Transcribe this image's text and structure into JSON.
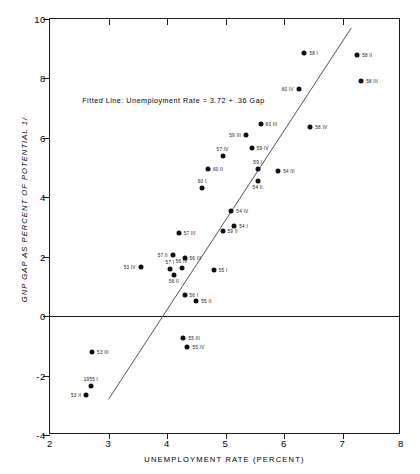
{
  "chart_data": {
    "type": "scatter",
    "title": "",
    "xlabel": "UNEMPLOYMENT RATE (PERCENT)",
    "ylabel": "GNP GAP AS PERCENT OF POTENTIAL 1/",
    "xlim": [
      2,
      8
    ],
    "ylim": [
      -4,
      10
    ],
    "xticks": [
      2,
      3,
      4,
      5,
      6,
      7,
      8
    ],
    "yticks": [
      -4,
      -2,
      0,
      2,
      4,
      6,
      8,
      10
    ],
    "grid": false,
    "legend": null,
    "annotation": "Fitted Line: Unemployment Rate = 3.72 + .36 Gap",
    "fit_line": {
      "x0": 3.0,
      "y0": -2.8,
      "x1": 7.15,
      "y1": 9.7
    },
    "points": [
      {
        "label": "58 I",
        "x": 6.35,
        "y": 8.85,
        "pos": "r"
      },
      {
        "label": "58 II",
        "x": 7.25,
        "y": 8.8,
        "pos": "r"
      },
      {
        "label": "58 III",
        "x": 7.32,
        "y": 7.9,
        "pos": "r"
      },
      {
        "label": "60 IV",
        "x": 6.25,
        "y": 7.65,
        "pos": "l"
      },
      {
        "label": "60 III",
        "x": 5.6,
        "y": 6.45,
        "pos": "r"
      },
      {
        "label": "58 IV",
        "x": 6.45,
        "y": 6.35,
        "pos": "r"
      },
      {
        "label": "59 III",
        "x": 5.35,
        "y": 6.1,
        "pos": "l"
      },
      {
        "label": "59 IV",
        "x": 5.45,
        "y": 5.65,
        "pos": "r"
      },
      {
        "label": "57 IV",
        "x": 4.95,
        "y": 5.4,
        "pos": "t"
      },
      {
        "label": "60 II",
        "x": 4.7,
        "y": 4.95,
        "pos": "r"
      },
      {
        "label": "59 I",
        "x": 5.55,
        "y": 4.95,
        "pos": "t"
      },
      {
        "label": "54 III",
        "x": 5.9,
        "y": 4.9,
        "pos": "r"
      },
      {
        "label": "54 II",
        "x": 5.55,
        "y": 4.55,
        "pos": "b"
      },
      {
        "label": "60 I",
        "x": 4.6,
        "y": 4.3,
        "pos": "t"
      },
      {
        "label": "54 IV",
        "x": 5.1,
        "y": 3.55,
        "pos": "r"
      },
      {
        "label": "54 I",
        "x": 5.15,
        "y": 3.05,
        "pos": "r"
      },
      {
        "label": "59 II",
        "x": 4.95,
        "y": 2.85,
        "pos": "r"
      },
      {
        "label": "57 III",
        "x": 4.2,
        "y": 2.8,
        "pos": "r"
      },
      {
        "label": "57 II",
        "x": 4.1,
        "y": 2.05,
        "pos": "l"
      },
      {
        "label": "56 III",
        "x": 4.3,
        "y": 1.95,
        "pos": "r"
      },
      {
        "label": "53 IV",
        "x": 3.55,
        "y": 1.65,
        "pos": "l"
      },
      {
        "label": "57 I",
        "x": 4.05,
        "y": 1.6,
        "pos": "t"
      },
      {
        "label": "56 IV",
        "x": 4.25,
        "y": 1.62,
        "pos": "t"
      },
      {
        "label": "56 II",
        "x": 4.12,
        "y": 1.4,
        "pos": "b"
      },
      {
        "label": "55 I",
        "x": 4.8,
        "y": 1.55,
        "pos": "r"
      },
      {
        "label": "56 I",
        "x": 4.3,
        "y": 0.7,
        "pos": "r"
      },
      {
        "label": "55 II",
        "x": 4.5,
        "y": 0.5,
        "pos": "r"
      },
      {
        "label": "55 III",
        "x": 4.28,
        "y": -0.75,
        "pos": "r"
      },
      {
        "label": "55 IV",
        "x": 4.35,
        "y": -1.05,
        "pos": "r"
      },
      {
        "label": "53 III",
        "x": 2.72,
        "y": -1.2,
        "pos": "r"
      },
      {
        "label": "1955 I",
        "x": 2.7,
        "y": -2.35,
        "pos": "t"
      },
      {
        "label": "53 II",
        "x": 2.62,
        "y": -2.65,
        "pos": "l"
      }
    ]
  }
}
